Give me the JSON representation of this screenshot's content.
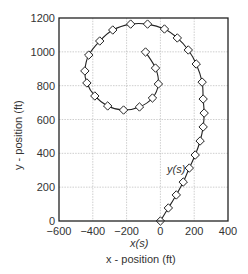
{
  "chart_data": {
    "type": "line",
    "title": "",
    "xlabel": "x - position (ft)",
    "ylabel": "y - position (ft)",
    "xlim": [
      -600,
      400
    ],
    "ylim": [
      0,
      1200
    ],
    "x_ticks": [
      -600,
      -400,
      -200,
      0,
      200,
      400
    ],
    "y_ticks": [
      0,
      200,
      400,
      600,
      800,
      1000,
      1200
    ],
    "x_tick_labels": [
      "−600",
      "−400",
      "−200",
      "0",
      "200",
      "400"
    ],
    "y_tick_labels": [
      "0",
      "200",
      "400",
      "600",
      "800",
      "1000",
      "1200"
    ],
    "grid": true,
    "legend": null,
    "annotations": [
      {
        "text": "y(s)",
        "x": 150,
        "y": 300
      },
      {
        "text": "x(s)",
        "x": -120,
        "y": -70
      }
    ],
    "series": [
      {
        "name": "spiral path",
        "marker": "diamond",
        "x": [
          0,
          47,
          94,
          135,
          171,
          206,
          235,
          253,
          259,
          253,
          247,
          212,
          165,
          100,
          24,
          -76,
          -176,
          -282,
          -359,
          -424,
          -447,
          -435,
          -388,
          -312,
          -218,
          -124,
          -47,
          -12,
          -29,
          -88
        ],
        "y": [
          0,
          77,
          154,
          230,
          313,
          390,
          473,
          556,
          638,
          721,
          821,
          928,
          1011,
          1082,
          1135,
          1164,
          1164,
          1129,
          1064,
          981,
          887,
          816,
          739,
          680,
          656,
          674,
          727,
          810,
          904,
          999
        ]
      }
    ]
  },
  "labels": {
    "xlabel": "x - position (ft)",
    "ylabel": "y - position (ft)",
    "x_annot": "x(s)",
    "y_annot": "y(s)"
  }
}
